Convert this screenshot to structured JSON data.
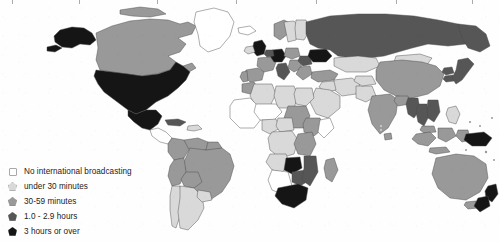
{
  "figure": {
    "kind": "choropleth-world-map",
    "background_color": "#fefefe",
    "width": 499,
    "height": 242
  },
  "legend": {
    "items": [
      {
        "label": "No international broadcasting",
        "color": "#ffffff",
        "swatch": "pentagon-outline"
      },
      {
        "label": "under 30 minutes",
        "color": "#d9d9d9",
        "swatch": "pentagon"
      },
      {
        "label": "30-59 minutes",
        "color": "#999999",
        "swatch": "pentagon"
      },
      {
        "label": "1.0 - 2.9 hours",
        "color": "#565656",
        "swatch": "pentagon"
      },
      {
        "label": "3 hours or over",
        "color": "#151515",
        "swatch": "pentagon"
      }
    ]
  },
  "map_data": {
    "type": "choropleth",
    "projection": "equirectangular-like",
    "classes": [
      {
        "id": "c0",
        "label": "No international broadcasting",
        "color": "#ffffff"
      },
      {
        "id": "c1",
        "label": "under 30 minutes",
        "color": "#d9d9d9"
      },
      {
        "id": "c2",
        "label": "30-59 minutes",
        "color": "#999999"
      },
      {
        "id": "c3",
        "label": "1.0 - 2.9 hours",
        "color": "#565656"
      },
      {
        "id": "c4",
        "label": "3 hours or over",
        "color": "#151515"
      }
    ],
    "regions": [
      {
        "name": "Alaska",
        "class": "c4"
      },
      {
        "name": "Canada",
        "class": "c2"
      },
      {
        "name": "United States",
        "class": "c4"
      },
      {
        "name": "Mexico",
        "class": "c4"
      },
      {
        "name": "Greenland",
        "class": "c0"
      },
      {
        "name": "Central America",
        "class": "c0"
      },
      {
        "name": "Caribbean",
        "class": "c1"
      },
      {
        "name": "Cuba",
        "class": "c3"
      },
      {
        "name": "Colombia",
        "class": "c2"
      },
      {
        "name": "Venezuela",
        "class": "c2"
      },
      {
        "name": "Brazil",
        "class": "c2"
      },
      {
        "name": "Peru",
        "class": "c2"
      },
      {
        "name": "Bolivia",
        "class": "c2"
      },
      {
        "name": "Chile",
        "class": "c1"
      },
      {
        "name": "Argentina",
        "class": "c1"
      },
      {
        "name": "United Kingdom",
        "class": "c4"
      },
      {
        "name": "Ireland",
        "class": "c1"
      },
      {
        "name": "France",
        "class": "c2"
      },
      {
        "name": "Spain",
        "class": "c2"
      },
      {
        "name": "Portugal",
        "class": "c2"
      },
      {
        "name": "Germany",
        "class": "c4"
      },
      {
        "name": "Netherlands",
        "class": "c3"
      },
      {
        "name": "Italy",
        "class": "c3"
      },
      {
        "name": "Norway",
        "class": "c2"
      },
      {
        "name": "Sweden",
        "class": "c1"
      },
      {
        "name": "Finland",
        "class": "c1"
      },
      {
        "name": "Poland",
        "class": "c2"
      },
      {
        "name": "Romania",
        "class": "c3"
      },
      {
        "name": "Bulgaria",
        "class": "c2"
      },
      {
        "name": "Greece",
        "class": "c2"
      },
      {
        "name": "Turkey",
        "class": "c2"
      },
      {
        "name": "Ukraine",
        "class": "c4"
      },
      {
        "name": "Russia",
        "class": "c3"
      },
      {
        "name": "Kazakhstan",
        "class": "c1"
      },
      {
        "name": "Mongolia",
        "class": "c1"
      },
      {
        "name": "China",
        "class": "c2"
      },
      {
        "name": "Japan",
        "class": "c3"
      },
      {
        "name": "North Korea",
        "class": "c3"
      },
      {
        "name": "South Korea",
        "class": "c3"
      },
      {
        "name": "India",
        "class": "c2"
      },
      {
        "name": "Pakistan",
        "class": "c1"
      },
      {
        "name": "Iran",
        "class": "c1"
      },
      {
        "name": "Iraq",
        "class": "c1"
      },
      {
        "name": "Saudi Arabia",
        "class": "c1"
      },
      {
        "name": "Egypt",
        "class": "c1"
      },
      {
        "name": "Libya",
        "class": "c1"
      },
      {
        "name": "Algeria",
        "class": "c1"
      },
      {
        "name": "Morocco",
        "class": "c2"
      },
      {
        "name": "Sudan",
        "class": "c2"
      },
      {
        "name": "Ethiopia",
        "class": "c2"
      },
      {
        "name": "Nigeria",
        "class": "c1"
      },
      {
        "name": "West Africa",
        "class": "c0"
      },
      {
        "name": "Congo",
        "class": "c1"
      },
      {
        "name": "Angola",
        "class": "c1"
      },
      {
        "name": "Zambia",
        "class": "c4"
      },
      {
        "name": "Zimbabwe",
        "class": "c3"
      },
      {
        "name": "Mozambique",
        "class": "c3"
      },
      {
        "name": "Madagascar",
        "class": "c2"
      },
      {
        "name": "South Africa",
        "class": "c4"
      },
      {
        "name": "Namibia",
        "class": "c0"
      },
      {
        "name": "Thailand",
        "class": "c3"
      },
      {
        "name": "Vietnam",
        "class": "c3"
      },
      {
        "name": "Myanmar",
        "class": "c3"
      },
      {
        "name": "Malaysia",
        "class": "c2"
      },
      {
        "name": "Indonesia",
        "class": "c2"
      },
      {
        "name": "Philippines",
        "class": "c1"
      },
      {
        "name": "Papua New Guinea",
        "class": "c4"
      },
      {
        "name": "Australia",
        "class": "c2"
      },
      {
        "name": "New Zealand",
        "class": "c4"
      }
    ]
  }
}
